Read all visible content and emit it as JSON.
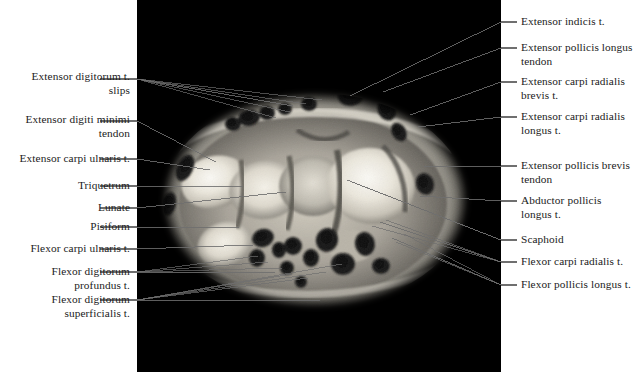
{
  "figure": {
    "image_panel_name": "wrist-mri-axial-section",
    "background_color": "#ffffff",
    "panel_color": "#000000",
    "leader_color": "#6f6f6f",
    "text_color": "#1b1b1b"
  },
  "labels_left": [
    {
      "id": "extensor-digitorum-slips",
      "text": "Extensor digitorum t.\nslips",
      "text_top": 70,
      "line_y": 79,
      "target_x": 293,
      "target_y": 106
    },
    {
      "id": "extensor-digiti-minimi-tendon",
      "text": "Extensor digiti minimi\ntendon",
      "text_top": 113,
      "line_y": 121,
      "target_x": 216,
      "target_y": 162
    },
    {
      "id": "extensor-carpi-ulnaris",
      "text": "Extensor carpi ulnaris t.",
      "text_top": 152,
      "line_y": 159,
      "target_x": 210,
      "target_y": 170
    },
    {
      "id": "triquetrum",
      "text": "Triquetrum",
      "text_top": 179,
      "line_y": 186,
      "target_x": 243,
      "target_y": 186
    },
    {
      "id": "lunate",
      "text": "Lunate",
      "text_top": 201,
      "line_y": 208,
      "target_x": 286,
      "target_y": 192
    },
    {
      "id": "pisiform",
      "text": "Pisiform",
      "text_top": 220,
      "line_y": 227,
      "target_x": 239,
      "target_y": 227
    },
    {
      "id": "flexor-carpi-ulnaris",
      "text": "Flexor carpi ulnaris t.",
      "text_top": 242,
      "line_y": 249,
      "target_x": 253,
      "target_y": 245
    },
    {
      "id": "flexor-digitorum-profundus",
      "text": "Flexor digitorum\nprofundus t.",
      "text_top": 265,
      "line_y": 272,
      "target_x": 275,
      "target_y": 272
    },
    {
      "id": "flexor-digitorum-superficialis",
      "text": "Flexor digitorum\nsuperficialis t.",
      "text_top": 293,
      "line_y": 300,
      "target_x": 320,
      "target_y": 300
    }
  ],
  "labels_right": [
    {
      "id": "extensor-indicis",
      "text": "Extensor indicis t.",
      "text_top": 15,
      "line_y": 22,
      "target_x": 350,
      "target_y": 96
    },
    {
      "id": "extensor-pollicis-longus-tendon",
      "text": "Extensor pollicis longus\ntendon",
      "text_top": 41,
      "line_y": 48,
      "target_x": 383,
      "target_y": 92
    },
    {
      "id": "extensor-carpi-radialis-brevis",
      "text": "Extensor carpi radialis\nbrevis t.",
      "text_top": 75,
      "line_y": 82,
      "target_x": 410,
      "target_y": 115
    },
    {
      "id": "extensor-carpi-radialis-longus",
      "text": "Extensor carpi radialis\nlongus t.",
      "text_top": 110,
      "line_y": 117,
      "target_x": 418,
      "target_y": 127
    },
    {
      "id": "extensor-pollicis-brevis-tendon",
      "text": "Extensor pollicis brevis\ntendon",
      "text_top": 159,
      "line_y": 166,
      "target_x": 424,
      "target_y": 166
    },
    {
      "id": "abductor-pollicis-longus",
      "text": "Abductor pollicis\nlongus t.",
      "text_top": 194,
      "line_y": 201,
      "target_x": 420,
      "target_y": 196
    },
    {
      "id": "scaphoid",
      "text": "Scaphoid",
      "text_top": 233,
      "line_y": 240,
      "target_x": 347,
      "target_y": 180
    },
    {
      "id": "flexor-carpi-radialis",
      "text": "Flexor carpi radialis t.",
      "text_top": 255,
      "line_y": 262,
      "target_x": 380,
      "target_y": 222
    },
    {
      "id": "flexor-pollicis-longus",
      "text": "Flexor pollicis longus t.",
      "text_top": 278,
      "line_y": 285,
      "target_x": 392,
      "target_y": 238
    }
  ],
  "scan": {
    "description": "Grayscale axial MRI slice through the proximal carpal row of a left wrist; bright cancellous bone of the carpals centrally, dark tendon cross-sections arranged dorsally and volarly around the rim.",
    "tendon_markers_dorsal": 8,
    "tendon_markers_volar": 10
  }
}
